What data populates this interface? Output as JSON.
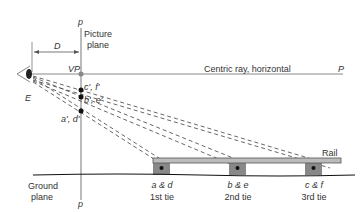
{
  "diagram": {
    "labels": {
      "p_top": "p",
      "p_bottom": "p",
      "picture_plane": [
        "Picture",
        "plane"
      ],
      "distance": "D",
      "vanishing_point": "VP",
      "eye": "E",
      "centric_ray": "Centric ray, horizontal",
      "centric_ray_end": "P",
      "point_cf": "c', f'",
      "point_be": "b', e'",
      "point_ad": "a', d'",
      "rail": "Rail",
      "ground_plane": [
        "Ground",
        "plane"
      ],
      "ties": [
        {
          "points": "a & d",
          "name": "1st tie"
        },
        {
          "points": "b & e",
          "name": "2nd tie"
        },
        {
          "points": "c & f",
          "name": "3rd tie"
        }
      ]
    },
    "colors": {
      "line": "#555555",
      "rail_fill": "#bbbbbb",
      "tie_fill": "#888888",
      "point": "#111111"
    }
  }
}
